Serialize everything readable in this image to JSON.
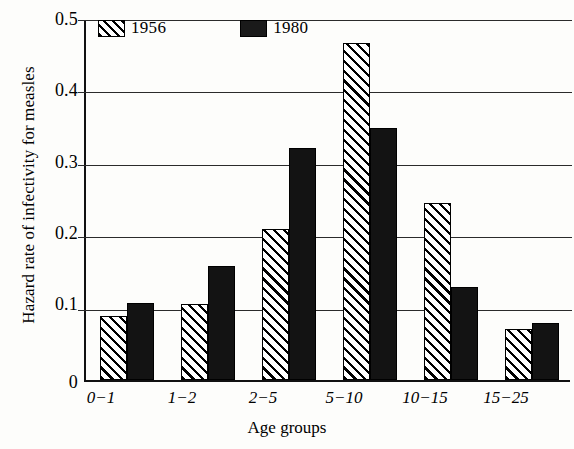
{
  "chart_data": {
    "type": "bar",
    "title": "",
    "xlabel": "Age groups",
    "ylabel": "Hazard rate of infectivity for measles",
    "categories": [
      "0−1",
      "1−2",
      "2−5",
      "5−10",
      "10−15",
      "15−25"
    ],
    "series": [
      {
        "name": "1956",
        "fill": "diagonal-hatch",
        "color": "#ffffff",
        "values": [
          0.089,
          0.105,
          0.208,
          0.465,
          0.245,
          0.071
        ]
      },
      {
        "name": "1980",
        "fill": "solid",
        "color": "#131313",
        "values": [
          0.107,
          0.157,
          0.32,
          0.348,
          0.129,
          0.079
        ]
      }
    ],
    "ylim": [
      0,
      0.5
    ],
    "yticks": [
      "0",
      "0.1",
      "0.2",
      "0.3",
      "0.4",
      "0.5"
    ],
    "ytick_values": [
      0,
      0.1,
      0.2,
      0.3,
      0.4,
      0.5
    ],
    "grid": "horizontal",
    "legend_position": "top-left-inside"
  },
  "legend": {
    "entries": [
      {
        "label": "1956",
        "swatch": "hatched-swatch"
      },
      {
        "label": "1980",
        "swatch": "solid-black-swatch"
      }
    ]
  },
  "axis": {
    "y_title": "Hazard rate of infectivity for measles",
    "x_title": "Age groups",
    "y_ticks": [
      "0.5",
      "0.4",
      "0.3",
      "0.2",
      "0.1",
      "0"
    ],
    "x_ticks": [
      "0−1",
      "1−2",
      "2−5",
      "5−10",
      "10−15",
      "15−25"
    ]
  }
}
